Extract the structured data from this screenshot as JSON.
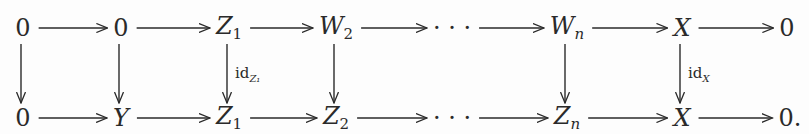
{
  "diagram": {
    "top_row": [
      {
        "id": "t0",
        "main": "0",
        "sub": "",
        "italic": false,
        "x": 23
      },
      {
        "id": "t1",
        "main": "0",
        "sub": "",
        "italic": false,
        "x": 121
      },
      {
        "id": "t2",
        "main": "Z",
        "sub": "1",
        "italic": true,
        "x": 229
      },
      {
        "id": "t3",
        "main": "W",
        "sub": "2",
        "italic": true,
        "x": 336
      },
      {
        "id": "t4",
        "main": "· · ·",
        "sub": "",
        "italic": false,
        "x": 452
      },
      {
        "id": "t5",
        "main": "W",
        "sub": "n",
        "italic": true,
        "x": 567
      },
      {
        "id": "t6",
        "main": "X",
        "sub": "",
        "italic": true,
        "x": 682
      },
      {
        "id": "t7",
        "main": "0",
        "sub": "",
        "italic": false,
        "x": 787
      }
    ],
    "bottom_row": [
      {
        "id": "b0",
        "main": "0",
        "sub": "",
        "italic": false,
        "x": 23
      },
      {
        "id": "b1",
        "main": "Y",
        "sub": "",
        "italic": true,
        "x": 121
      },
      {
        "id": "b2",
        "main": "Z",
        "sub": "1",
        "italic": true,
        "x": 229
      },
      {
        "id": "b3",
        "main": "Z",
        "sub": "2",
        "italic": true,
        "x": 336
      },
      {
        "id": "b4",
        "main": "· · ·",
        "sub": "",
        "italic": false,
        "x": 452
      },
      {
        "id": "b5",
        "main": "Z",
        "sub": "n",
        "italic": true,
        "x": 567
      },
      {
        "id": "b6",
        "main": "X",
        "sub": "",
        "italic": true,
        "x": 682
      },
      {
        "id": "b7",
        "main": "0.",
        "sub": "",
        "italic": false,
        "x": 790
      }
    ],
    "vertical_labels": [
      {
        "col": 2,
        "text": "id",
        "sub": "Z₁"
      },
      {
        "col": 6,
        "text": "id",
        "sub": "X"
      }
    ],
    "vertical_arrow_columns": [
      0,
      1,
      2,
      3,
      5,
      6
    ],
    "colors": {
      "ink": "#2a2a2a",
      "background": "#fdfdfd"
    }
  }
}
